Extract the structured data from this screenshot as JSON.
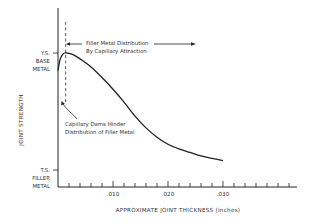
{
  "chart_data": {
    "type": "line",
    "title": "",
    "xlabel": "APPROXIMATE JOINT THICKNESS (inches)",
    "ylabel": "JOINT STRENGTH",
    "xlim": [
      0,
      0.0435
    ],
    "x_ticks": [
      {
        "value": 0.01,
        "label": ".010"
      },
      {
        "value": 0.02,
        "label": ".020"
      },
      {
        "value": 0.03,
        "label": ".030"
      }
    ],
    "x_minor_tick_step": 0.002,
    "y_levels": [
      {
        "name": "ys_base_metal",
        "value": 1.0,
        "label_lines": [
          "Y.S.",
          "BASE",
          "METAL"
        ]
      },
      {
        "name": "ts_filler_metal",
        "value": 0.0,
        "label_lines": [
          "T.S.",
          "FILLER",
          "METAL"
        ]
      }
    ],
    "ylim": [
      -0.15,
      1.35
    ],
    "grid": false,
    "series": [
      {
        "name": "Joint strength",
        "x": [
          0.0,
          0.0003,
          0.0006,
          0.0009,
          0.0012,
          0.0016,
          0.0022,
          0.003,
          0.004,
          0.006,
          0.008,
          0.01,
          0.012,
          0.014,
          0.016,
          0.018,
          0.02,
          0.022,
          0.024,
          0.026,
          0.028,
          0.03
        ],
        "y": [
          0.85,
          0.93,
          0.97,
          0.99,
          1.0,
          1.0,
          0.995,
          0.98,
          0.95,
          0.88,
          0.79,
          0.69,
          0.58,
          0.46,
          0.36,
          0.28,
          0.22,
          0.18,
          0.15,
          0.12,
          0.1,
          0.08
        ]
      }
    ],
    "reference_line": {
      "x": 0.0013,
      "style": "dashed"
    },
    "annotations": [
      {
        "name": "filler-distribution",
        "lines": [
          "Filler Metal Distribution",
          "By Capillary Attraction"
        ],
        "arrows": "left-and-right"
      },
      {
        "name": "capillary-dams",
        "lines": [
          "Capillary Dams Hinder",
          "Distribution of Filler Metal"
        ],
        "arrows": "points-to-reference-line"
      }
    ]
  }
}
